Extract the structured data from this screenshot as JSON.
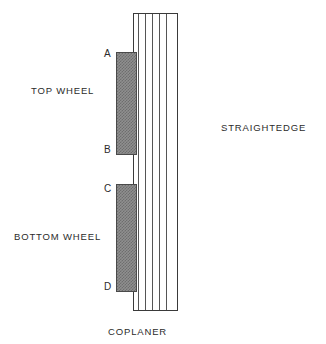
{
  "diagram": {
    "title": "COPLANER",
    "components": {
      "straightedge": {
        "label": "STRAIGHTEDGE",
        "stripe_count": 5,
        "fill": "#ffffff",
        "border_color": "#3a3a3a"
      },
      "top_wheel": {
        "label": "TOP WHEEL",
        "start_point": "A",
        "end_point": "B",
        "fill": "#8f8f8f",
        "border_color": "#4a4a4a"
      },
      "bottom_wheel": {
        "label": "BOTTOM WHEEL",
        "start_point": "C",
        "end_point": "D",
        "fill": "#8f8f8f",
        "border_color": "#4a4a4a"
      }
    },
    "point_labels": {
      "a": "A",
      "b": "B",
      "c": "C",
      "d": "D"
    },
    "background": "#ffffff",
    "text_color": "#2b2b2b"
  }
}
